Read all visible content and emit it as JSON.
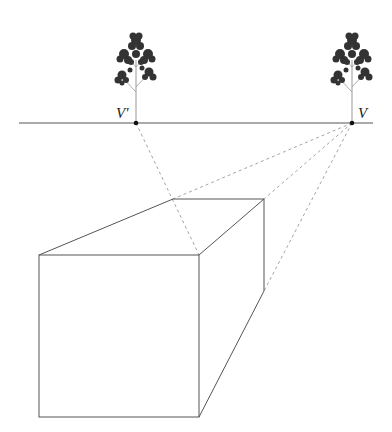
{
  "diagram": {
    "labels": {
      "left_vanishing_point": "V'",
      "right_vanishing_point": "V"
    },
    "colors": {
      "solid_line": "#555555",
      "dashed_line": "#9a9a9a",
      "tree": "#333333",
      "point": "#111111"
    }
  }
}
